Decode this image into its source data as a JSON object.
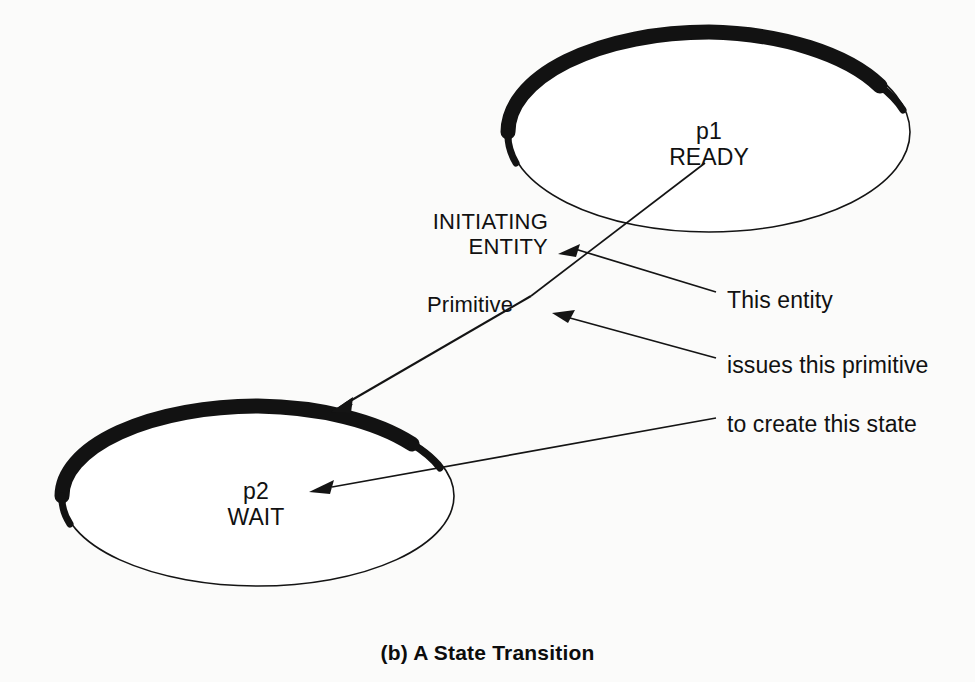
{
  "figure": {
    "caption": "(b) A State Transition",
    "background_color": "#fbfbfa",
    "ink_color": "#111111"
  },
  "states": [
    {
      "id": "p1",
      "name": "p1",
      "label": "READY",
      "center_x": 709,
      "center_y": 132,
      "rx": 201,
      "ry": 100
    },
    {
      "id": "p2",
      "name": "p2",
      "label": "WAIT",
      "center_x": 258,
      "center_y": 496,
      "rx": 196,
      "ry": 90
    }
  ],
  "annotations": {
    "initiating_entity": {
      "line1": "INITIATING",
      "line2": "ENTITY"
    },
    "primitive": "Primitive",
    "right_notes": [
      "This entity",
      "issues this primitive",
      "to create this state"
    ]
  }
}
